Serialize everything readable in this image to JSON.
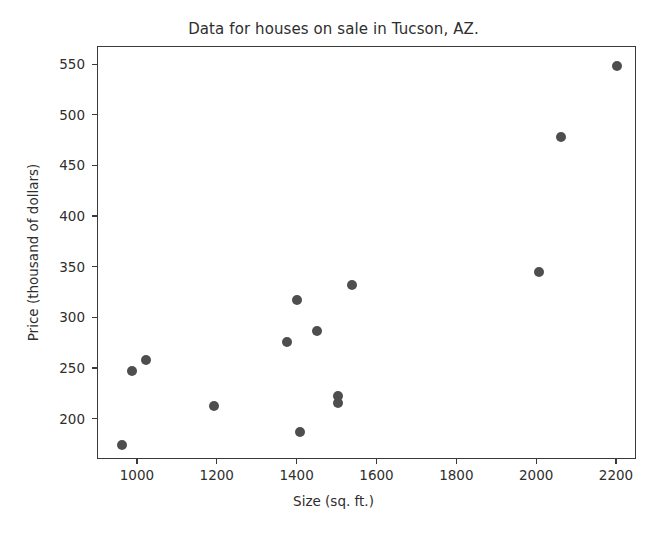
{
  "chart_data": {
    "type": "scatter",
    "title": "Data for houses on sale in Tucson, AZ.",
    "xlabel": "Size (sq. ft.)",
    "ylabel": "Price (thousand of dollars)",
    "xlim": [
      900,
      2250
    ],
    "ylim": [
      160,
      568
    ],
    "grid": false,
    "legend": null,
    "marker_color": "#4e4e4e",
    "marker_shape": "circle",
    "xticks": [
      1000,
      1200,
      1400,
      1600,
      1800,
      2000,
      2200
    ],
    "xtick_labels": [
      "1000",
      "1200",
      "1400",
      "1600",
      "1800",
      "2000",
      "2200"
    ],
    "yticks": [
      200,
      250,
      300,
      350,
      400,
      450,
      500,
      550
    ],
    "ytick_labels": [
      "200",
      "250",
      "300",
      "350",
      "400",
      "450",
      "500",
      "550"
    ],
    "series": [
      {
        "name": "houses",
        "x": [
          960,
          985,
          1020,
          1190,
          1373,
          1398,
          1405,
          1448,
          1500,
          1500,
          1535,
          2005,
          2060,
          2200
        ],
        "y": [
          175,
          248,
          259,
          213,
          277,
          318,
          188,
          287,
          216,
          223,
          333,
          346,
          479,
          549
        ]
      }
    ]
  }
}
